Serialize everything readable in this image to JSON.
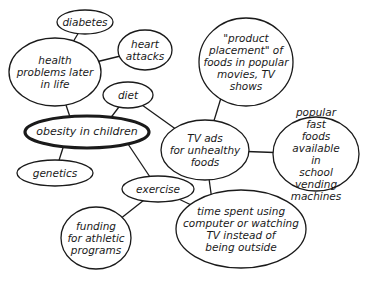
{
  "diagram": {
    "type": "concept-map",
    "central_topic": "obesity in children",
    "nodes": [
      {
        "id": "diabetes",
        "label": "diabetes",
        "cx": 85,
        "cy": 22,
        "rx": 28,
        "ry": 12
      },
      {
        "id": "heart",
        "label": "heart\nattacks",
        "cx": 145,
        "cy": 50,
        "rx": 27,
        "ry": 20
      },
      {
        "id": "health",
        "label": "health\nproblems later\nin life",
        "cx": 55,
        "cy": 72,
        "rx": 46,
        "ry": 34
      },
      {
        "id": "diet",
        "label": "diet",
        "cx": 128,
        "cy": 95,
        "rx": 25,
        "ry": 13
      },
      {
        "id": "obesity",
        "label": "obesity in children",
        "cx": 87,
        "cy": 132,
        "rx": 62,
        "ry": 16,
        "main": true
      },
      {
        "id": "product",
        "label": "\"product\nplacement\" of\nfoods in popular\nmovies, TV\nshows",
        "cx": 246,
        "cy": 62,
        "rx": 47,
        "ry": 44
      },
      {
        "id": "tvads",
        "label": "TV ads\nfor unhealthy\nfoods",
        "cx": 205,
        "cy": 150,
        "rx": 44,
        "ry": 30
      },
      {
        "id": "fastfood",
        "label": "popular\nfast foods\navailable in\nschool vending\nmachines",
        "cx": 316,
        "cy": 154,
        "rx": 43,
        "ry": 37
      },
      {
        "id": "genetics",
        "label": "genetics",
        "cx": 55,
        "cy": 173,
        "rx": 38,
        "ry": 13
      },
      {
        "id": "exercise",
        "label": "exercise",
        "cx": 158,
        "cy": 189,
        "rx": 36,
        "ry": 13
      },
      {
        "id": "funding",
        "label": "funding\nfor athletic\nprograms",
        "cx": 96,
        "cy": 238,
        "rx": 35,
        "ry": 31
      },
      {
        "id": "timespent",
        "label": "time spent using\ncomputer or watching\nTV instead of\nbeing outside",
        "cx": 241,
        "cy": 229,
        "rx": 65,
        "ry": 39
      }
    ],
    "edges": [
      {
        "from": "diabetes",
        "to": "health"
      },
      {
        "from": "heart",
        "to": "health"
      },
      {
        "from": "health",
        "to": "obesity"
      },
      {
        "from": "diet",
        "to": "obesity"
      },
      {
        "from": "diet",
        "to": "tvads"
      },
      {
        "from": "product",
        "to": "tvads"
      },
      {
        "from": "tvads",
        "to": "fastfood"
      },
      {
        "from": "tvads",
        "to": "timespent"
      },
      {
        "from": "obesity",
        "to": "genetics"
      },
      {
        "from": "obesity",
        "to": "exercise"
      },
      {
        "from": "exercise",
        "to": "funding"
      },
      {
        "from": "exercise",
        "to": "timespent"
      }
    ]
  },
  "labels": {
    "diabetes": "diabetes",
    "heart": "heart\nattacks",
    "health": "health\nproblems later\nin life",
    "diet": "diet",
    "obesity": "obesity in children",
    "product": "\"product\nplacement\" of\nfoods in popular\nmovies, TV\nshows",
    "tvads": "TV ads\nfor unhealthy\nfoods",
    "fastfood": "popular\nfast foods\navailable in\nschool vending\nmachines",
    "genetics": "genetics",
    "exercise": "exercise",
    "funding": "funding\nfor athletic\nprograms",
    "timespent": "time spent using\ncomputer or watching\nTV instead of\nbeing outside"
  }
}
